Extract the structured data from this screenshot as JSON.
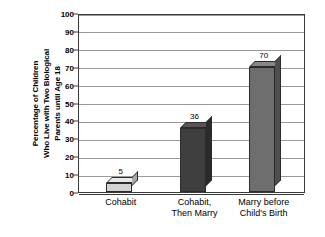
{
  "chart_data": {
    "type": "bar",
    "title": "",
    "xlabel": "",
    "ylabel": "Percentage of Children Who Live with Two Biological Parents until Age 18",
    "ylabel_lines": [
      "Percentage of Children",
      "Who Live with Two Biological",
      "Parents until Age 18"
    ],
    "categories": [
      "Cohabit",
      "Cohabit, Then Marry",
      "Marry before Child's Birth"
    ],
    "category_lines": [
      [
        "Cohabit"
      ],
      [
        "Cohabit,",
        "Then Marry"
      ],
      [
        "Marry before",
        "Child's Birth"
      ]
    ],
    "values": [
      5,
      36,
      70
    ],
    "value_labels": [
      "5",
      "36",
      "70"
    ],
    "ylim": [
      0,
      100
    ],
    "ytick_step": 10,
    "yticks": [
      0,
      10,
      20,
      30,
      40,
      50,
      60,
      70,
      80,
      90,
      100
    ],
    "ytick_labels": [
      "0",
      "10",
      "20",
      "30",
      "40",
      "50",
      "60",
      "70",
      "80",
      "90",
      "100"
    ],
    "grid": true,
    "legend": false,
    "legend_position": "none",
    "bar_colors": [
      "#d4d4d4",
      "#3f3f3f",
      "#6e6e6e"
    ],
    "bar_top_colors": [
      "#e8e8e8",
      "#555555",
      "#868686"
    ],
    "bar_side_colors": [
      "#a8a8a8",
      "#2b2b2b",
      "#4f4f4f"
    ],
    "axis_color": "#3a3a3a",
    "gridline_color": "#9a9a9a",
    "background_color": "#ffffff",
    "text_color": "#000000"
  }
}
